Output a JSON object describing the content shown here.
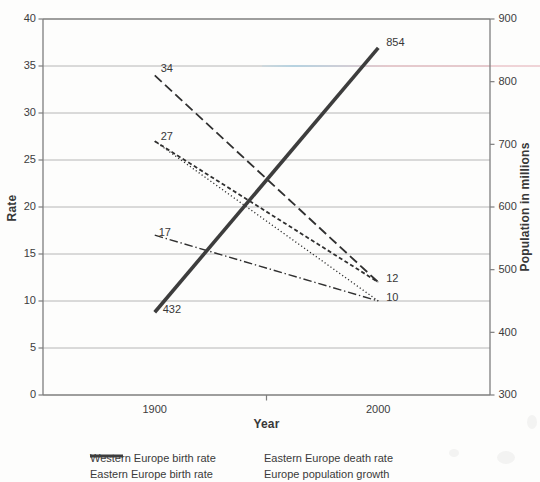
{
  "colors": {
    "ink": "#303030",
    "thick_line": "#3d3d3d",
    "grid": "#b6b6b6",
    "frame": "#7e7e7e",
    "text": "#3c3c3c",
    "artifact_blue": "#a8d0e4",
    "artifact_pink": "#eac3c8"
  },
  "chart_data": {
    "type": "line",
    "title": "",
    "xlabel": "Year",
    "ylabel_left": "Rate",
    "ylabel_right": "Population in millions",
    "x_categories": [
      "1900",
      "2000"
    ],
    "ylim_left": [
      0,
      40
    ],
    "ylim_right": [
      300,
      900
    ],
    "y_left_ticks": [
      40,
      35,
      30,
      25,
      20,
      15,
      10,
      5,
      0
    ],
    "y_right_ticks": [
      900,
      800,
      700,
      600,
      500,
      400,
      300
    ],
    "grid": "horizontal gridlines every 5 (left axis)",
    "legend_position": "bottom, two columns",
    "series": [
      {
        "name": "Eastern Europe birth rate",
        "axis": "left",
        "style": "long-dash",
        "values": [
          34,
          12
        ]
      },
      {
        "name": "Western Europe birth rate",
        "axis": "left",
        "style": "short-dash",
        "values": [
          27,
          12
        ]
      },
      {
        "name": "Eastern Europe death rate",
        "axis": "left",
        "style": "dotted",
        "values": [
          27,
          10
        ]
      },
      {
        "name": "",
        "axis": "left",
        "style": "dash-dot",
        "values": [
          17,
          10
        ],
        "in_legend": false
      },
      {
        "name": "Europe population growth",
        "axis": "right",
        "style": "solid-thick",
        "values": [
          432,
          854
        ]
      }
    ],
    "point_labels": [
      {
        "text": "34",
        "xi": 0,
        "value": 34,
        "axis": "left",
        "dx": 6,
        "dy": -6
      },
      {
        "text": "27",
        "xi": 0,
        "value": 27,
        "axis": "left",
        "dx": 6,
        "dy": -4
      },
      {
        "text": "17",
        "xi": 0,
        "value": 17,
        "axis": "left",
        "dx": 4,
        "dy": -2
      },
      {
        "text": "12",
        "xi": 1,
        "value": 12,
        "axis": "left",
        "dx": 8,
        "dy": -3
      },
      {
        "text": "10",
        "xi": 1,
        "value": 10,
        "axis": "left",
        "dx": 8,
        "dy": -3
      },
      {
        "text": "432",
        "xi": 0,
        "value": 432,
        "axis": "right",
        "dx": 8,
        "dy": -2
      },
      {
        "text": "854",
        "xi": 1,
        "value": 854,
        "axis": "right",
        "dx": 8,
        "dy": -5
      }
    ],
    "legend": [
      {
        "label": "Western Europe birth rate",
        "style": "short-dash"
      },
      {
        "label": "Eastern Europe death rate",
        "style": "dotted"
      },
      {
        "label": "Eastern Europe birth rate",
        "style": "long-dash"
      },
      {
        "label": "Europe population growth",
        "style": "solid-thick"
      }
    ]
  }
}
